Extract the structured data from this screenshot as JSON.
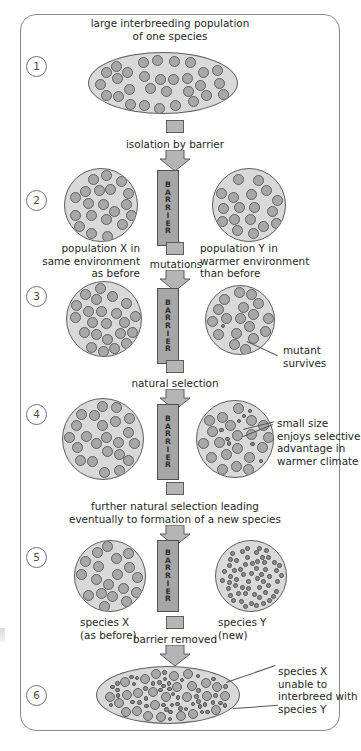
{
  "diagram": {
    "panel_border_color": "#8a8a8a",
    "population_fill": "#d9d9d9",
    "organism_fill": "#a8a8a8",
    "barrier_fill": "#a6a6a6",
    "arrow_fill": "#b5b5b5",
    "barrier_label": "BARRIER",
    "barrier_letters": [
      "B",
      "A",
      "R",
      "R",
      "I",
      "E",
      "R"
    ],
    "stages": [
      {
        "number": "1",
        "caption_above": "large interbreeding population\nof one species",
        "shape": "ellipse",
        "populations": [
          {
            "name": "single-population",
            "organism_size": "large",
            "count": 46
          }
        ]
      },
      {
        "number": "2",
        "arrow_label": "isolation by barrier",
        "left_caption": "population X in\nsame environment\nas before",
        "right_caption": "population Y in\nwarmer environment\nthan before",
        "populations": [
          {
            "name": "population-x",
            "organism_size": "large",
            "count": 26
          },
          {
            "name": "population-y",
            "organism_size": "large",
            "count": 26
          }
        ]
      },
      {
        "number": "3",
        "arrow_label": "mutations",
        "annotation": "mutant\nsurvives",
        "populations": [
          {
            "name": "population-x",
            "organism_size": "large",
            "count": 28
          },
          {
            "name": "population-y",
            "organism_size": "large",
            "count": 26,
            "mutants": 1
          }
        ]
      },
      {
        "number": "4",
        "arrow_label": "natural selection",
        "annotation": "small size\nenjoys selective\nadvantage in\nwarmer climate",
        "populations": [
          {
            "name": "population-x",
            "organism_size": "large",
            "count": 30
          },
          {
            "name": "population-y",
            "organism_size": "mixed",
            "count": 28,
            "mutants": 7
          }
        ]
      },
      {
        "number": "5",
        "arrow_label": "further natural selection leading\neventually to formation of a new species",
        "left_caption": "species X\n(as before)",
        "right_caption": "species Y\n(new)",
        "populations": [
          {
            "name": "species-x",
            "organism_size": "large",
            "count": 28
          },
          {
            "name": "species-y",
            "organism_size": "small",
            "count": 56
          }
        ]
      },
      {
        "number": "6",
        "arrow_label": "barrier removed",
        "annotation": "species X\nunable to\ninterbreed with\nspecies Y",
        "shape": "ellipse",
        "populations": [
          {
            "name": "mixed-population",
            "organism_size": "mixed",
            "count": 40,
            "small_count": 60
          }
        ]
      }
    ]
  }
}
